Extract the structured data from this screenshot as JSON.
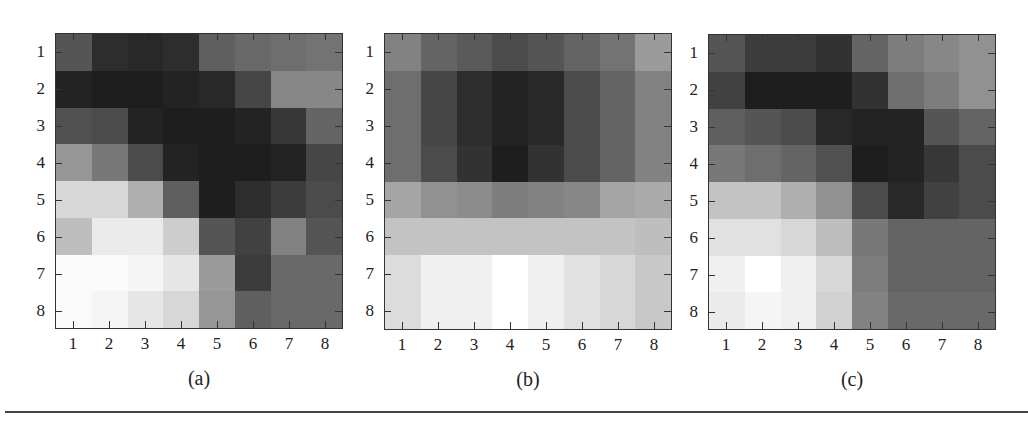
{
  "chart_data": [
    {
      "type": "heatmap",
      "title": "(a)",
      "caption": "(a)",
      "xlabel": "",
      "ylabel": "",
      "x_ticks": [
        "1",
        "2",
        "3",
        "4",
        "5",
        "6",
        "7",
        "8"
      ],
      "y_ticks": [
        "1",
        "2",
        "3",
        "4",
        "5",
        "6",
        "7",
        "8"
      ],
      "colormap": "grayscale (0=black, 255=white)",
      "values": [
        [
          85,
          45,
          40,
          45,
          95,
          105,
          110,
          115
        ],
        [
          35,
          30,
          30,
          35,
          40,
          70,
          135,
          135
        ],
        [
          80,
          75,
          35,
          30,
          30,
          35,
          55,
          100
        ],
        [
          150,
          120,
          75,
          35,
          30,
          30,
          35,
          70
        ],
        [
          215,
          215,
          175,
          95,
          30,
          45,
          60,
          75
        ],
        [
          190,
          235,
          235,
          205,
          85,
          65,
          130,
          85
        ],
        [
          250,
          250,
          245,
          230,
          155,
          60,
          105,
          105
        ],
        [
          250,
          245,
          230,
          215,
          150,
          95,
          105,
          105
        ]
      ]
    },
    {
      "type": "heatmap",
      "title": "(b)",
      "caption": "(b)",
      "xlabel": "",
      "ylabel": "",
      "x_ticks": [
        "1",
        "2",
        "3",
        "4",
        "5",
        "6",
        "7",
        "8"
      ],
      "y_ticks": [
        "1",
        "2",
        "3",
        "4",
        "5",
        "6",
        "7",
        "8"
      ],
      "colormap": "grayscale (0=black, 255=white)",
      "values": [
        [
          130,
          100,
          90,
          75,
          85,
          100,
          115,
          155
        ],
        [
          110,
          70,
          45,
          35,
          40,
          75,
          100,
          130
        ],
        [
          110,
          70,
          45,
          35,
          40,
          75,
          100,
          130
        ],
        [
          110,
          75,
          50,
          30,
          50,
          75,
          100,
          130
        ],
        [
          165,
          145,
          140,
          125,
          130,
          135,
          165,
          170
        ],
        [
          195,
          195,
          195,
          195,
          195,
          195,
          195,
          190
        ],
        [
          220,
          240,
          240,
          255,
          240,
          225,
          215,
          200
        ],
        [
          220,
          240,
          240,
          255,
          240,
          225,
          215,
          200
        ]
      ]
    },
    {
      "type": "heatmap",
      "title": "(c)",
      "caption": "(c)",
      "xlabel": "",
      "ylabel": "",
      "x_ticks": [
        "1",
        "2",
        "3",
        "4",
        "5",
        "6",
        "7",
        "8"
      ],
      "y_ticks": [
        "1",
        "2",
        "3",
        "4",
        "5",
        "6",
        "7",
        "8"
      ],
      "colormap": "grayscale (0=black, 255=white)",
      "values": [
        [
          85,
          60,
          60,
          50,
          100,
          125,
          135,
          145
        ],
        [
          65,
          30,
          30,
          30,
          50,
          110,
          125,
          145
        ],
        [
          95,
          85,
          75,
          40,
          35,
          35,
          85,
          100
        ],
        [
          120,
          110,
          100,
          80,
          30,
          35,
          55,
          75
        ],
        [
          195,
          195,
          175,
          145,
          75,
          40,
          65,
          75
        ],
        [
          225,
          225,
          215,
          190,
          120,
          100,
          100,
          100
        ],
        [
          240,
          255,
          240,
          215,
          125,
          100,
          100,
          100
        ],
        [
          235,
          245,
          240,
          210,
          130,
          105,
          105,
          105
        ]
      ]
    }
  ],
  "panels": [
    {
      "caption": "(a)"
    },
    {
      "caption": "(b)"
    },
    {
      "caption": "(c)"
    }
  ],
  "ticks": [
    "1",
    "2",
    "3",
    "4",
    "5",
    "6",
    "7",
    "8"
  ]
}
